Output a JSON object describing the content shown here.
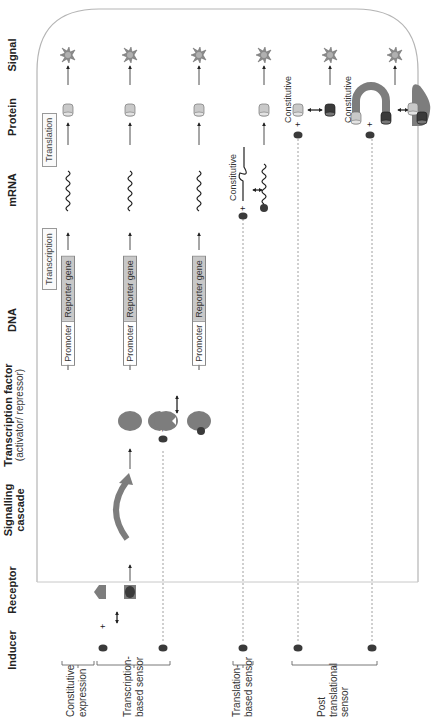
{
  "figure": {
    "orientation": "rotated 90 degrees counter-clockwise",
    "columns": [
      {
        "key": "inducer",
        "label": "Inducer",
        "sub": ""
      },
      {
        "key": "receptor",
        "label": "Receptor",
        "sub": ""
      },
      {
        "key": "signalling",
        "label": "Signalling",
        "sub": "cascade"
      },
      {
        "key": "tf",
        "label": "Transcription factor",
        "sub": "(activator/ repressor)"
      },
      {
        "key": "dna",
        "label": "DNA",
        "sub": ""
      },
      {
        "key": "mrna",
        "label": "mRNA",
        "sub": ""
      },
      {
        "key": "protein",
        "label": "Protein",
        "sub": ""
      },
      {
        "key": "signal",
        "label": "Signal",
        "sub": ""
      }
    ],
    "process_labels": {
      "transcription": "Transcription",
      "translation": "Translation"
    },
    "gene": {
      "promoter": "Promoter",
      "reporter": "Reporter gene"
    },
    "constitutive_label": "Constitutive",
    "row_groups": [
      {
        "label_line1": "Constitutive",
        "label_line2": "expression",
        "label_line3": ""
      },
      {
        "label_line1": "Transcription-",
        "label_line2": "based sensor",
        "label_line3": ""
      },
      {
        "label_line1": "Translation-",
        "label_line2": "based sensor",
        "label_line3": ""
      },
      {
        "label_line1": "Post",
        "label_line2": "translational",
        "label_line3": "sensor"
      }
    ],
    "symbols": {
      "plus": "+",
      "signal_icon": "starburst-icon",
      "protein_icon": "cylinder-icon",
      "inducer_icon": "ellipse-dot-icon"
    },
    "colors": {
      "cell_outline": "#b5b5b5",
      "molecule_dark": "#3a3a3a",
      "molecule_mid": "#7d7d7d",
      "molecule_light": "#c9c9c9",
      "signal_star": "#8a8a8a",
      "text": "#222222"
    }
  }
}
